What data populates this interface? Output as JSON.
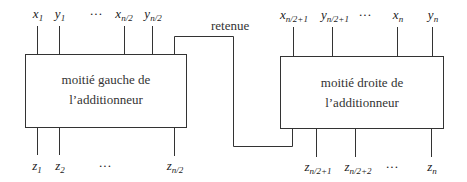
{
  "diagram": {
    "left_box": {
      "line1": "moitié gauche de",
      "line2": "l’additionneur"
    },
    "right_box": {
      "line1": "moitié droite de",
      "line2": "l’additionneur"
    },
    "carry_label": "retenue",
    "left_inputs": [
      {
        "var": "x",
        "sub": "1"
      },
      {
        "var": "y",
        "sub": "1"
      },
      {
        "var": "···",
        "sub": ""
      },
      {
        "var": "x",
        "sub": "n/2"
      },
      {
        "var": "y",
        "sub": "n/2"
      }
    ],
    "right_inputs": [
      {
        "var": "x",
        "sub": "n/2+1"
      },
      {
        "var": "y",
        "sub": "n/2+1"
      },
      {
        "var": "···",
        "sub": ""
      },
      {
        "var": "x",
        "sub": "n"
      },
      {
        "var": "y",
        "sub": "n"
      }
    ],
    "left_outputs": [
      {
        "var": "z",
        "sub": "1"
      },
      {
        "var": "z",
        "sub": "2"
      },
      {
        "var": "···",
        "sub": ""
      },
      {
        "var": "z",
        "sub": "n/2"
      }
    ],
    "right_outputs": [
      {
        "var": "z",
        "sub": "n/2+1"
      },
      {
        "var": "z",
        "sub": "n/2+2"
      },
      {
        "var": "···",
        "sub": ""
      },
      {
        "var": "z",
        "sub": "n"
      }
    ]
  }
}
